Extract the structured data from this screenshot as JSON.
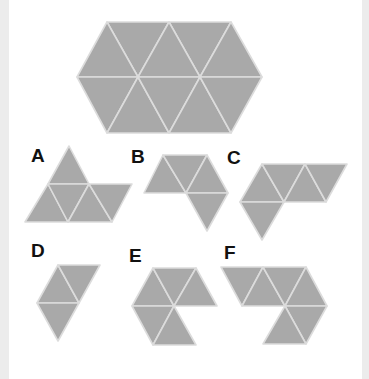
{
  "colors": {
    "fill": "#a9a9a9",
    "grid_line": "#dcdcdc",
    "label": "#111111",
    "background": "#ffffff",
    "edge": "#ececec"
  },
  "target": {
    "name": "hexagon",
    "triangle_count": 10,
    "triangles": [
      [
        [
          107,
          22
        ],
        [
          169,
          22
        ],
        [
          138,
          77
        ]
      ],
      [
        [
          169,
          22
        ],
        [
          231,
          22
        ],
        [
          200,
          77
        ]
      ],
      [
        [
          77,
          77
        ],
        [
          107,
          22
        ],
        [
          138,
          77
        ]
      ],
      [
        [
          138,
          77
        ],
        [
          169,
          22
        ],
        [
          200,
          77
        ]
      ],
      [
        [
          200,
          77
        ],
        [
          231,
          22
        ],
        [
          262,
          77
        ]
      ],
      [
        [
          77,
          77
        ],
        [
          138,
          77
        ],
        [
          107,
          133
        ]
      ],
      [
        [
          107,
          133
        ],
        [
          138,
          77
        ],
        [
          169,
          133
        ]
      ],
      [
        [
          138,
          77
        ],
        [
          200,
          77
        ],
        [
          169,
          133
        ]
      ],
      [
        [
          169,
          133
        ],
        [
          200,
          77
        ],
        [
          231,
          133
        ]
      ],
      [
        [
          200,
          77
        ],
        [
          262,
          77
        ],
        [
          231,
          133
        ]
      ]
    ]
  },
  "options": [
    {
      "label": "A",
      "label_pos": [
        31,
        146
      ],
      "triangles": [
        [
          [
            48,
            184
          ],
          [
            69,
            146
          ],
          [
            89,
            184
          ]
        ],
        [
          [
            25,
            222
          ],
          [
            48,
            184
          ],
          [
            68,
            222
          ]
        ],
        [
          [
            48,
            184
          ],
          [
            89,
            184
          ],
          [
            68,
            222
          ]
        ],
        [
          [
            68,
            222
          ],
          [
            89,
            184
          ],
          [
            112,
            222
          ]
        ],
        [
          [
            89,
            184
          ],
          [
            132,
            184
          ],
          [
            112,
            222
          ]
        ]
      ]
    },
    {
      "label": "B",
      "label_pos": [
        131,
        147
      ],
      "triangles": [
        [
          [
            144,
            193
          ],
          [
            163,
            155
          ],
          [
            186,
            193
          ]
        ],
        [
          [
            163,
            155
          ],
          [
            207,
            155
          ],
          [
            186,
            193
          ]
        ],
        [
          [
            186,
            193
          ],
          [
            207,
            155
          ],
          [
            228,
            193
          ]
        ],
        [
          [
            186,
            193
          ],
          [
            228,
            193
          ],
          [
            207,
            231
          ]
        ]
      ]
    },
    {
      "label": "C",
      "label_pos": [
        227,
        148
      ],
      "triangles": [
        [
          [
            240,
            202
          ],
          [
            262,
            164
          ],
          [
            284,
            202
          ]
        ],
        [
          [
            262,
            164
          ],
          [
            305,
            164
          ],
          [
            284,
            202
          ]
        ],
        [
          [
            284,
            202
          ],
          [
            305,
            164
          ],
          [
            326,
            202
          ]
        ],
        [
          [
            305,
            164
          ],
          [
            347,
            164
          ],
          [
            326,
            202
          ]
        ],
        [
          [
            240,
            202
          ],
          [
            284,
            202
          ],
          [
            262,
            240
          ]
        ]
      ]
    },
    {
      "label": "D",
      "label_pos": [
        31,
        241
      ],
      "triangles": [
        [
          [
            37,
            303
          ],
          [
            58,
            265
          ],
          [
            79,
            303
          ]
        ],
        [
          [
            58,
            265
          ],
          [
            100,
            265
          ],
          [
            79,
            303
          ]
        ],
        [
          [
            37,
            303
          ],
          [
            79,
            303
          ],
          [
            58,
            341
          ]
        ]
      ]
    },
    {
      "label": "E",
      "label_pos": [
        129,
        246
      ],
      "triangles": [
        [
          [
            132,
            306
          ],
          [
            153,
            268
          ],
          [
            174,
            306
          ]
        ],
        [
          [
            153,
            268
          ],
          [
            196,
            268
          ],
          [
            174,
            306
          ]
        ],
        [
          [
            174,
            306
          ],
          [
            196,
            268
          ],
          [
            217,
            306
          ]
        ],
        [
          [
            132,
            306
          ],
          [
            174,
            306
          ],
          [
            153,
            345
          ]
        ],
        [
          [
            153,
            345
          ],
          [
            174,
            306
          ],
          [
            196,
            345
          ]
        ]
      ]
    },
    {
      "label": "F",
      "label_pos": [
        224,
        243
      ],
      "triangles": [
        [
          [
            221,
            267
          ],
          [
            263,
            267
          ],
          [
            242,
            306
          ]
        ],
        [
          [
            242,
            306
          ],
          [
            263,
            267
          ],
          [
            285,
            306
          ]
        ],
        [
          [
            263,
            267
          ],
          [
            306,
            267
          ],
          [
            285,
            306
          ]
        ],
        [
          [
            285,
            306
          ],
          [
            306,
            267
          ],
          [
            327,
            306
          ]
        ],
        [
          [
            285,
            306
          ],
          [
            327,
            306
          ],
          [
            306,
            344
          ]
        ],
        [
          [
            263,
            344
          ],
          [
            285,
            306
          ],
          [
            306,
            344
          ]
        ]
      ]
    }
  ]
}
